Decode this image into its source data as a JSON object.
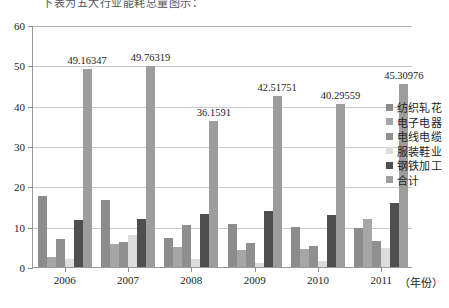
{
  "top_caption": "下表为五大行业能耗总量图示：",
  "chart_data": {
    "type": "bar",
    "title": "",
    "xlabel": "（年份）",
    "ylabel": "",
    "ylim": [
      0,
      60
    ],
    "yticks": [
      0,
      10,
      20,
      30,
      40,
      50,
      60
    ],
    "grid": true,
    "legend_position": "right",
    "categories": [
      "2006",
      "2007",
      "2008",
      "2009",
      "2010",
      "2011"
    ],
    "series": [
      {
        "name": "纺织轧花",
        "color": "#8c8c8c",
        "values": [
          17.6,
          16.5,
          7.3,
          10.7,
          10.0,
          9.6
        ]
      },
      {
        "name": "电子电器",
        "color": "#a6a6a6",
        "values": [
          2.4,
          5.8,
          5.0,
          4.1,
          4.4,
          12.0
        ]
      },
      {
        "name": "电线电缆",
        "color": "#8f8f8f",
        "values": [
          6.9,
          6.2,
          10.5,
          6.0,
          5.3,
          6.4
        ]
      },
      {
        "name": "服装鞋业",
        "color": "#dcdcdc",
        "values": [
          1.9,
          8.0,
          2.0,
          0.9,
          1.5,
          4.6
        ]
      },
      {
        "name": "钢铁加工",
        "color": "#4f4f4f",
        "values": [
          11.6,
          11.9,
          13.2,
          14.0,
          12.9,
          15.9
        ]
      },
      {
        "name": "合计",
        "color": "#9d9d9d",
        "values": [
          49.16347,
          49.76319,
          36.1591,
          42.51751,
          40.29559,
          45.30976
        ]
      }
    ],
    "data_labels": {
      "series": "合计",
      "values": [
        "49.16347",
        "49.76319",
        "36.1591",
        "42.51751",
        "40.29559",
        "45.30976"
      ]
    }
  },
  "legend": {
    "items": [
      {
        "label": "纺织轧花",
        "color": "#8c8c8c"
      },
      {
        "label": "电子电器",
        "color": "#a6a6a6"
      },
      {
        "label": "电线电缆",
        "color": "#8f8f8f"
      },
      {
        "label": "服装鞋业",
        "color": "#dcdcdc"
      },
      {
        "label": "钢铁加工",
        "color": "#4f4f4f"
      },
      {
        "label": "合计",
        "color": "#9d9d9d"
      }
    ]
  }
}
